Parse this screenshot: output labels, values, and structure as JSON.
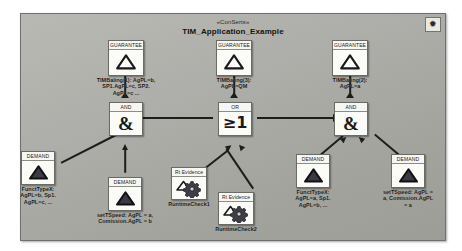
{
  "diagram": {
    "stereotype": "«ConSerts»",
    "title": "TIM_Application_Example",
    "corner_icon": "sparkle-icon",
    "corner_glyph": "✹"
  },
  "palette": {
    "frame_bg": "#aeaeaa",
    "tile_bg": "#f2f2ee",
    "line": "#1d1d1a",
    "text": "#121210"
  },
  "guarantees": [
    {
      "id": "g1",
      "tile_label": "GUARANTEE",
      "caption": "TIMBaling(1): AgPL=b,\nSP1.AgPL=c, SP2.\nAgPL=c ...",
      "icon": "guarantee-triangle-icon"
    },
    {
      "id": "g3",
      "tile_label": "GUARANTEE",
      "caption": "TIMBaling(3):\nAgPL=QM",
      "icon": "guarantee-triangle-icon"
    },
    {
      "id": "g2",
      "tile_label": "GUARANTEE",
      "caption": "TIMBaling(2):\nAgPL=a",
      "icon": "guarantee-triangle-icon"
    }
  ],
  "gates": [
    {
      "id": "and-left",
      "tile_label": "AND",
      "symbol": "&",
      "icon": "and-gate-icon"
    },
    {
      "id": "or-mid",
      "tile_label": "OR",
      "symbol": "≥1",
      "icon": "or-gate-icon"
    },
    {
      "id": "and-right",
      "tile_label": "AND",
      "symbol": "&",
      "icon": "and-gate-icon"
    }
  ],
  "demands": [
    {
      "id": "d1",
      "tile_label": "DEMAND",
      "caption": "FunctTypeX:\nAgPL=b, Sp1.\nAgPL=c, ...",
      "icon": "demand-triangle-icon"
    },
    {
      "id": "d2",
      "tile_label": "DEMAND",
      "caption": "setTSpeed: AgPL = a,\nComission.AgPL = b",
      "icon": "demand-triangle-icon"
    },
    {
      "id": "d3",
      "tile_label": "DEMAND",
      "caption": "FunctTypeX:\nAgPL=a, Sp1.\nAgPL=b, ...",
      "icon": "demand-triangle-icon"
    },
    {
      "id": "d4",
      "tile_label": "DEMAND",
      "caption": "setTSpeed: AgPL =\na, Comission.AgPL\n= a",
      "icon": "demand-triangle-icon"
    }
  ],
  "evidences": [
    {
      "id": "rt1",
      "tile_label": "Rt Evidence",
      "caption": "RuntimeCheck1",
      "icon": "runtime-evidence-gear-icon"
    },
    {
      "id": "rt2",
      "tile_label": "Rt Evidence",
      "caption": "RuntimeCheck2",
      "icon": "runtime-evidence-gear-icon"
    }
  ]
}
